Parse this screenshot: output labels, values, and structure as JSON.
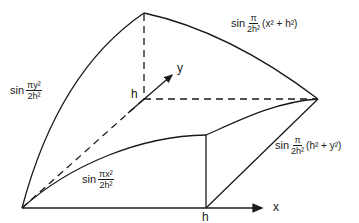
{
  "diagram": {
    "axes": {
      "x_label": "x",
      "y_label": "y",
      "x_tick_label": "h",
      "y_tick_label": "h"
    },
    "formulas": {
      "left_edge": {
        "fn": "sin",
        "num": "πy²",
        "den": "2h²",
        "tail": ""
      },
      "bottom_curve": {
        "fn": "sin",
        "num": "πx²",
        "den": "2h²",
        "tail": ""
      },
      "top_right_edge": {
        "fn": "sin",
        "num": "π",
        "den": "2h²",
        "tail": "(x² + h²)"
      },
      "right_face": {
        "fn": "sin",
        "num": "π",
        "den": "2h²",
        "tail": "(h² + y²)"
      }
    },
    "colors": {
      "stroke": "#1a1a1a",
      "background": "#ffffff"
    }
  }
}
